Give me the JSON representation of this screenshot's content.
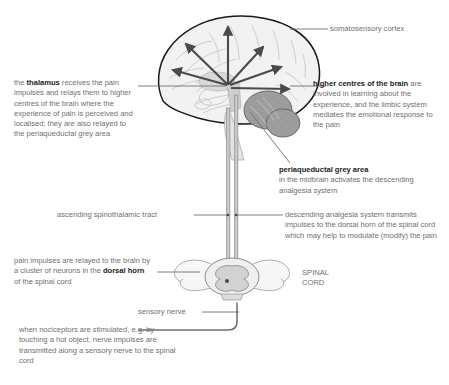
{
  "diagram": {
    "colors": {
      "body_text": "#6f6f70",
      "emphasis_text": "#232323",
      "leader_line": "#6f6f70",
      "arrow": "#4a4a4a",
      "brain_outline": "#1a1a1a",
      "brain_fill": "#f2f2f2",
      "brain_detail": "#b9b9b9",
      "cerebellum_fill": "#9d9d9d",
      "tract_fill": "#c9c9c9",
      "tract_stroke": "#7a7a7a",
      "cord_fill": "#efefef",
      "cord_grey_matter": "#d2d2d2",
      "background": "#ffffff"
    },
    "callouts": {
      "somatosensory_cortex": {
        "label": "somatosensory cortex"
      },
      "thalamus": {
        "lead": "the ",
        "bold": "thalamus",
        "rest": " receives the pain impulses and relays them to higher centres of the brain where the experience of pain is perceived and localised; they are also relayed to the periaqueductal grey area"
      },
      "higher_centres": {
        "bold": "higher centres of the brain",
        "rest": " are involved in learning about the experience, and the limbic system mediates the emotional response to the pain"
      },
      "periaqueductal": {
        "bold": "periaqueductal grey area",
        "rest": "in the midbrain activates the descending analgesia system"
      },
      "ascending_tract": {
        "label": "ascending spinothalamic tract"
      },
      "descending_system": {
        "text": "descending analgesia system transmits impulses to the dorsal horn of the spinal cord which may help to modulate (modify) the pain"
      },
      "dorsal_horn": {
        "lead": "pain impulses are relayed to the brain by a cluster of neurons in the ",
        "bold": "dorsal horn",
        "rest": " of the spinal cord"
      },
      "spinal_cord": {
        "line1": "SPINAL",
        "line2": "CORD"
      },
      "sensory_nerve": {
        "label": "sensory nerve"
      },
      "nociceptors": {
        "text": "when nociceptors are stimulated, e.g. by touching a hot object, nerve impulses are transmitted along a sensory nerve to the spinal cord"
      }
    }
  }
}
